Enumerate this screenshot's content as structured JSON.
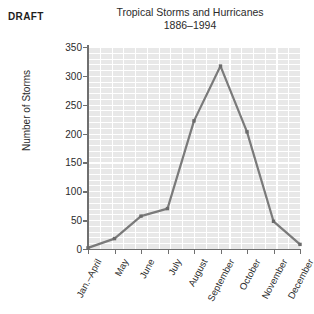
{
  "draft_label": "DRAFT",
  "chart_data": {
    "type": "line",
    "title": "Tropical Storms and Hurricanes",
    "subtitle": "1886–1994",
    "xlabel": "",
    "ylabel": "Number of Storms",
    "categories": [
      "Jan.–April",
      "May",
      "June",
      "July",
      "August",
      "September",
      "October",
      "November",
      "December"
    ],
    "values": [
      2,
      18,
      57,
      70,
      222,
      317,
      203,
      48,
      8
    ],
    "series": [
      {
        "name": "Number of Storms",
        "values": [
          2,
          18,
          57,
          70,
          222,
          317,
          203,
          48,
          8
        ]
      }
    ],
    "ylim": [
      0,
      350
    ],
    "ytick_labels": [
      "350",
      "300",
      "250",
      "200",
      "150",
      "100",
      "50",
      "0"
    ],
    "ytick_values": [
      350,
      300,
      250,
      200,
      150,
      100,
      50,
      0
    ],
    "ytick_step": 50,
    "grid": true,
    "minor_grid": true,
    "legend": false,
    "legend_position": "none",
    "marker": "square",
    "line_color": "#7a7a7a",
    "marker_color": "#6a6a6a",
    "plot_background": "#e8e8e8",
    "gridline_color": "#ffffff",
    "axis_color": "#6f6f6f",
    "text_color": "#2b2b2b"
  }
}
